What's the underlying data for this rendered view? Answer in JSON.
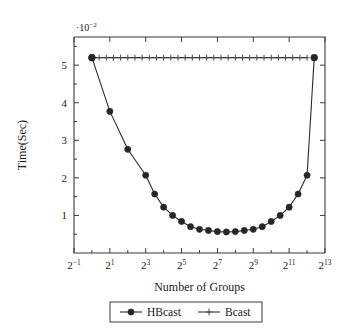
{
  "chart_data": {
    "type": "line",
    "title": "",
    "xlabel": "Number of Groups",
    "ylabel": "Time(Sec)",
    "y_multiplier": "·10⁻²",
    "y_multiplier_parts": {
      "dot": "·",
      "base": "10",
      "exp": "−2"
    },
    "x_scale": "log2",
    "xlim_exp": [
      -1,
      13
    ],
    "ylim": [
      0,
      5.75
    ],
    "yticks": [
      1,
      2,
      3,
      4,
      5
    ],
    "ytick_labels": [
      "1",
      "2",
      "3",
      "4",
      "5"
    ],
    "xticks_exp": [
      -1,
      1,
      3,
      5,
      7,
      9,
      11,
      13
    ],
    "xtick_labels": [
      "2⁻¹",
      "2¹",
      "2³",
      "2⁵",
      "2⁷",
      "2⁹",
      "2¹¹",
      "2¹³"
    ],
    "xtick_label_parts": [
      {
        "base": "2",
        "exp": "−1"
      },
      {
        "base": "2",
        "exp": "1"
      },
      {
        "base": "2",
        "exp": "3"
      },
      {
        "base": "2",
        "exp": "5"
      },
      {
        "base": "2",
        "exp": "7"
      },
      {
        "base": "2",
        "exp": "9"
      },
      {
        "base": "2",
        "exp": "11"
      },
      {
        "base": "2",
        "exp": "13"
      }
    ],
    "grid": false,
    "legend_position": "below-axes",
    "series": [
      {
        "name": "HBcast",
        "marker": "filled-circle",
        "color": "#262626",
        "x_exp": [
          0,
          1,
          2,
          3,
          3.5,
          4,
          4.5,
          5,
          5.5,
          6,
          6.5,
          7,
          7.5,
          8,
          8.5,
          9,
          9.5,
          10,
          10.5,
          11,
          11.5,
          12
        ],
        "values": [
          5.2,
          3.77,
          2.76,
          2.07,
          1.57,
          1.22,
          1.0,
          0.84,
          0.7,
          0.63,
          0.6,
          0.57,
          0.56,
          0.57,
          0.6,
          0.63,
          0.7,
          0.84,
          1.0,
          1.22,
          1.57,
          2.07
        ],
        "x_exp_full": [
          0,
          1,
          2,
          3,
          3.5,
          4,
          4.5,
          5,
          5.5,
          6,
          6.5,
          7,
          7.5,
          8,
          8.5,
          9,
          9.5,
          10,
          10.5,
          11,
          11.5,
          12
        ]
      },
      {
        "name": "Bcast",
        "marker": "plus",
        "color": "#4a4a4a",
        "constant_value": 5.2,
        "x_exp_start": 0,
        "x_exp_end": 12,
        "n_markers": 31
      }
    ]
  },
  "legend": {
    "entries": [
      {
        "label": "HBcast",
        "marker": "filled-circle"
      },
      {
        "label": "Bcast",
        "marker": "plus"
      }
    ]
  },
  "colors": {
    "axis": "#3a3a3a",
    "hbcast": "#262626",
    "bcast": "#4a4a4a",
    "background": "#ffffff"
  }
}
